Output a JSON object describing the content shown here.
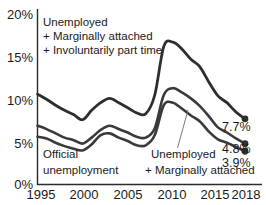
{
  "chart_data": {
    "type": "line",
    "title": "",
    "xlabel": "",
    "ylabel": "",
    "xlim": [
      1995,
      2018
    ],
    "ylim": [
      0,
      20
    ],
    "grid": false,
    "legend_position": "inline-annotations",
    "x_ticks": [
      "1995",
      "2000",
      "2005",
      "2010",
      "2015",
      "2018"
    ],
    "x_tick_values": [
      1995,
      2000,
      2005,
      2010,
      2015,
      2018
    ],
    "y_ticks": [
      "0%",
      "5%",
      "10%",
      "15%",
      "20%"
    ],
    "y_tick_values": [
      0,
      5,
      10,
      15,
      20
    ],
    "x": [
      1995,
      1996,
      1997,
      1998,
      1999,
      2000,
      2001,
      2002,
      2003,
      2004,
      2005,
      2006,
      2007,
      2008,
      2009,
      2010,
      2011,
      2012,
      2013,
      2014,
      2015,
      2016,
      2017,
      2018
    ],
    "series": [
      {
        "name": "Unemployed + Marginally attached + Involuntarily part time",
        "color": "#2e2e2e",
        "end_label": "7.7%",
        "values": [
          10.6,
          10.0,
          9.3,
          8.7,
          8.2,
          7.6,
          8.7,
          9.6,
          10.1,
          9.6,
          9.0,
          8.4,
          8.3,
          10.5,
          16.2,
          16.7,
          15.9,
          14.7,
          13.8,
          12.0,
          10.4,
          9.6,
          8.5,
          7.7
        ]
      },
      {
        "name": "Unemployed + Marginally attached",
        "color": "#3a3a3a",
        "end_label": "4.8%",
        "values": [
          6.9,
          6.5,
          6.0,
          5.5,
          5.2,
          4.8,
          5.5,
          6.4,
          6.9,
          6.5,
          6.1,
          5.6,
          5.5,
          6.6,
          10.5,
          11.3,
          10.8,
          10.1,
          9.2,
          8.0,
          6.7,
          6.1,
          5.4,
          4.8
        ]
      },
      {
        "name": "Official unemployment",
        "color": "#3a3a3a",
        "end_label": "3.9%",
        "values": [
          5.6,
          5.4,
          4.9,
          4.5,
          4.2,
          4.0,
          4.7,
          5.8,
          6.0,
          5.5,
          5.1,
          4.6,
          4.6,
          5.8,
          9.3,
          9.6,
          8.9,
          8.1,
          7.4,
          6.2,
          5.3,
          4.9,
          4.4,
          3.9
        ]
      }
    ],
    "annotations": [
      {
        "id": "top-annotation",
        "lines": [
          "Unemployed",
          "+ Marginally attached",
          "+ Involuntarily part time"
        ],
        "x": 1995.9,
        "y": 19.2
      },
      {
        "id": "official-annotation",
        "lines": [
          "Official",
          "unemployment"
        ],
        "x": 1995.9,
        "y": 3.6
      },
      {
        "id": "marginal-annotation",
        "lines": [
          "Unemployed",
          "+ Marginally attached"
        ],
        "x": 2008.6,
        "y": 3.2
      }
    ]
  }
}
